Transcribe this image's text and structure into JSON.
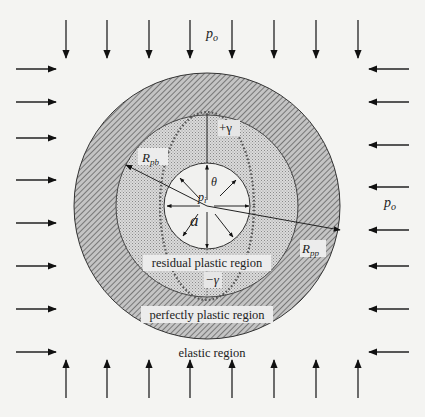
{
  "diagram": {
    "labels": {
      "far_field_pressure_top": "p",
      "far_field_pressure_top_sub": "o",
      "far_field_pressure_right": "p",
      "far_field_pressure_right_sub": "o",
      "internal_pressure": "p",
      "internal_pressure_sub": "i",
      "cavity_radius": "a",
      "angle": "θ",
      "plus_gamma": "+γ",
      "minus_gamma": "−γ",
      "radius_residual_boundary": "R",
      "radius_residual_boundary_sub": "pb",
      "radius_plastic_boundary": "R",
      "radius_plastic_boundary_sub": "pp",
      "region_residual": "residual plastic region",
      "region_perfect": "perfectly plastic region",
      "region_elastic": "elastic region"
    },
    "colors": {
      "background": "#f4f4f2",
      "ink": "#222222",
      "hatch_bg": "#bdbdbd",
      "hatch_line": "#555555",
      "stipple_bg": "#d6d6d6",
      "stipple_dot": "#8a8a8a",
      "cavity": "#f1f1ef"
    }
  }
}
